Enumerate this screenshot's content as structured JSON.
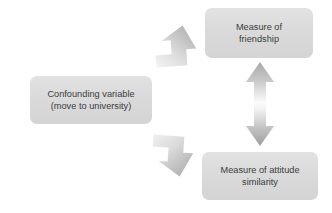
{
  "diagram": {
    "type": "flow-diagram",
    "background_color": "#ffffff",
    "node_fill_color": "#dcdcdc",
    "node_text_color": "#3b3b3b",
    "arrow_color": "#bfbfbf",
    "nodes": [
      {
        "id": "confounding",
        "line1": "Confounding variable",
        "line2": "(move to university)"
      },
      {
        "id": "friendship",
        "line1": "Measure of",
        "line2": "friendship"
      },
      {
        "id": "similarity",
        "line1": "Measure of attitude",
        "line2": "similarity"
      }
    ],
    "arrows": [
      {
        "id": "confounding-to-friendship",
        "icon": "arrow-up-right-icon",
        "direction": "up-right",
        "from": "confounding",
        "to": "friendship"
      },
      {
        "id": "confounding-to-similarity",
        "icon": "arrow-down-right-icon",
        "direction": "down-right",
        "from": "confounding",
        "to": "similarity"
      },
      {
        "id": "friendship-similarity-association",
        "icon": "arrow-double-vertical-icon",
        "direction": "bidirectional-vertical",
        "from": "friendship",
        "to": "similarity"
      }
    ]
  }
}
